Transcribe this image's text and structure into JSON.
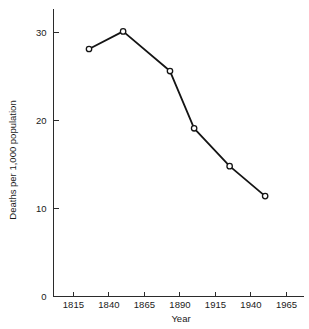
{
  "figure": {
    "background_color": "#ffffff",
    "line_color": "#141414",
    "axis_color": "#2b2b2b",
    "marker_fill": "#ffffff"
  },
  "chart_data": {
    "type": "line",
    "title": "",
    "xlabel": "Year",
    "ylabel": "Deaths per 1,000 population",
    "x": [
      1826,
      1850,
      1883,
      1900,
      1925,
      1950
    ],
    "values": [
      28.1,
      30.1,
      25.6,
      19.1,
      14.8,
      11.4
    ],
    "series": [
      {
        "name": "Deaths per 1,000 population",
        "x": [
          1826,
          1850,
          1883,
          1900,
          1925,
          1950
        ],
        "values": [
          28.1,
          30.1,
          25.6,
          19.1,
          14.8,
          11.4
        ]
      }
    ],
    "xlim": [
      1801,
      1977
    ],
    "ylim": [
      0,
      32.7
    ],
    "xticks": [
      1815,
      1840,
      1865,
      1890,
      1915,
      1940,
      1965
    ],
    "xtick_labels": [
      "1815",
      "1840",
      "1865",
      "1890",
      "1915",
      "1940",
      "1965"
    ],
    "yticks": [
      0,
      10,
      20,
      30
    ],
    "ytick_labels": [
      "0",
      "10",
      "20",
      "30"
    ],
    "grid": false,
    "legend": false,
    "legend_position": "none",
    "marker": "circle-open"
  }
}
